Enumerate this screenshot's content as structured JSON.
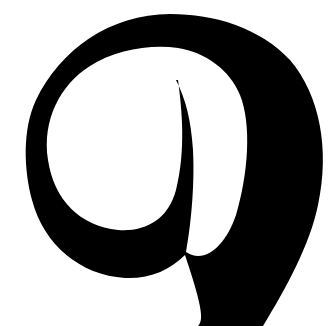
{
  "image": {
    "description": "Large black serif numeral-like glyph (resembling a '9') on white background",
    "glyph": "9",
    "colors": {
      "foreground": "#000000",
      "background": "#ffffff"
    }
  }
}
